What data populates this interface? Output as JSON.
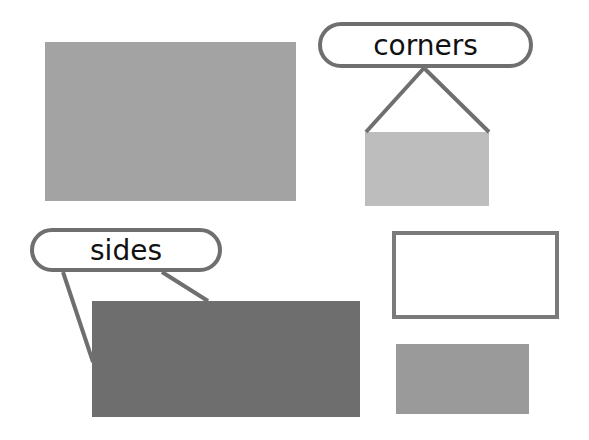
{
  "labels": {
    "corners": "corners",
    "sides": "sides"
  },
  "colors": {
    "large_rect": "#a3a3a3",
    "small_light_rect": "#bdbdbd",
    "dark_rect": "#6e6e6e",
    "outline_rect_border": "#7a7a7a",
    "small_mid_rect": "#9a9a9a",
    "callout_stroke": "#6f6f6f"
  },
  "shapes": [
    {
      "id": "large-gray-rect",
      "x": 45,
      "y": 42,
      "w": 251,
      "h": 159
    },
    {
      "id": "corners-rect",
      "x": 365,
      "y": 132,
      "w": 124,
      "h": 74
    },
    {
      "id": "sides-rect",
      "x": 92,
      "y": 301,
      "w": 268,
      "h": 116
    },
    {
      "id": "outline-rect",
      "x": 392,
      "y": 231,
      "w": 167,
      "h": 88
    },
    {
      "id": "small-mid-rect",
      "x": 396,
      "y": 344,
      "w": 133,
      "h": 70
    }
  ]
}
